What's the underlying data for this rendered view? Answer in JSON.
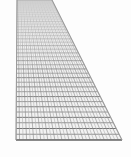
{
  "image": {
    "subject": "wire-mesh-screen",
    "description": "Gray woven wire mesh screen photographed in steep perspective",
    "width": 131,
    "height": 157,
    "background_color": "#fdfdfd"
  },
  "mesh": {
    "name": "wire-mesh",
    "wire_color": "#8f8f8f",
    "wire_color_light": "#b4b4b4",
    "wire_color_dark": "#6e6e6e",
    "fill_color": "#f2f2f2",
    "edge_color": "#9a9a9a",
    "shadow_color": "#d8d8d8",
    "horizontal_wire_count": 44,
    "vertical_wire_count": 30,
    "note": "Mesh narrows to a vertical strip at the top and widens into a trapezoid toward the bottom"
  },
  "geometry": {
    "top_left_x": 17.0,
    "top_right_x": 52.0,
    "top_y": 0.0,
    "break_y": 30.0,
    "bottom_left_x": 16.0,
    "bottom_right_x": 122.0,
    "bottom_y": 140.0,
    "left_edge_slope": -0.008,
    "right_edge_slope": 0.636
  },
  "rendering": {
    "horizontal_spacing_top": 2.6,
    "horizontal_spacing_bottom": 6.0,
    "vertical_spacing_top": 1.2,
    "vertical_spacing_bottom": 3.6,
    "perspective_exponent": 1.85,
    "line_width_top": 0.45,
    "line_width_bottom": 1.05
  }
}
